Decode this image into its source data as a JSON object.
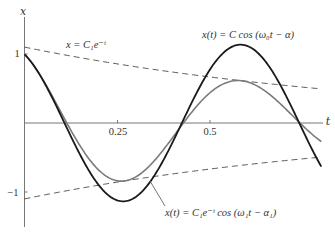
{
  "chart_data": {
    "type": "line",
    "title": "",
    "xlabel": "t",
    "ylabel": "x",
    "xlim": [
      0,
      0.8
    ],
    "ylim": [
      -1.5,
      1.6
    ],
    "grid": false,
    "x_ticks": [
      {
        "value": 0.25,
        "label": "0.25"
      },
      {
        "value": 0.5,
        "label": "0.5"
      }
    ],
    "y_ticks": [
      {
        "value": 1,
        "label": "1"
      },
      {
        "value": -1,
        "label": "−1"
      }
    ],
    "x": [
      0,
      0.05,
      0.1,
      0.15,
      0.2,
      0.25,
      0.3,
      0.35,
      0.4,
      0.45,
      0.5,
      0.55,
      0.6,
      0.65,
      0.7,
      0.75,
      0.8
    ],
    "series": [
      {
        "name": "undamped",
        "annotation": "x(t) = C cos (ω₀t − α)",
        "style": "solid-black",
        "color": "#1a1a1a",
        "model": {
          "kind": "cos",
          "amp": 1.135,
          "omega": 9.93,
          "phase": 0.5,
          "decay": 0
        },
        "values": [
          0.996,
          0.617,
          0.088,
          -0.461,
          -0.9,
          -1.121,
          -1.071,
          -0.763,
          -0.273,
          0.287,
          0.774,
          1.076,
          1.118,
          0.889,
          0.445,
          -0.106,
          -0.632
        ]
      },
      {
        "name": "damped",
        "annotation": "x(t) = C₁e⁻ᵗ cos (ω₁t − α₁)",
        "style": "solid-gray",
        "color": "#7a7a7a",
        "model": {
          "kind": "cos",
          "amp": 1.1,
          "omega": 10.0,
          "phase": 0.43,
          "decay": 1
        },
        "values": [
          1.0,
          0.625,
          0.14,
          -0.333,
          -0.682,
          -0.838,
          -0.781,
          -0.547,
          -0.207,
          0.151,
          0.437,
          0.595,
          0.597,
          0.458,
          0.225,
          -0.039,
          -0.269
        ]
      },
      {
        "name": "upper-envelope",
        "annotation": "x = C₁e⁻ᵗ",
        "style": "dashed",
        "color": "#444444",
        "model": {
          "kind": "exp",
          "amp": 1.1,
          "decay": 1
        },
        "values": [
          1.1,
          1.046,
          0.995,
          0.947,
          0.901,
          0.857,
          0.815,
          0.775,
          0.737,
          0.701,
          0.667,
          0.635,
          0.604,
          0.574,
          0.546,
          0.52,
          0.494
        ]
      },
      {
        "name": "lower-envelope",
        "annotation": "",
        "style": "dashed",
        "color": "#444444",
        "model": {
          "kind": "exp",
          "amp": -1.1,
          "decay": 1
        },
        "values": [
          -1.1,
          -1.046,
          -0.995,
          -0.947,
          -0.901,
          -0.857,
          -0.815,
          -0.775,
          -0.737,
          -0.701,
          -0.667,
          -0.635,
          -0.604,
          -0.574,
          -0.546,
          -0.52,
          -0.494
        ]
      }
    ],
    "annotations": {
      "undamped_label": "x(t) = C cos (ω₀t − α)",
      "envelope_label": "x = C₁e⁻ᵗ",
      "damped_label": "x(t) = C₁e⁻ᵗ cos (ω₁t − α₁)"
    },
    "axis_labels": {
      "y": "x",
      "x": "t"
    },
    "tick_labels": {
      "x_025": "0.25",
      "x_05": "0.5",
      "y_1": "1",
      "y_m1": "−1"
    }
  }
}
